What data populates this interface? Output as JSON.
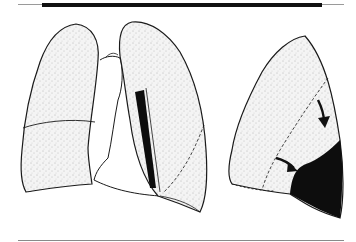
{
  "figure": {
    "panels": [
      {
        "name": "frontal-lungs-view",
        "has_black_region": true
      },
      {
        "name": "lateral-left-lung-view",
        "has_black_region": true,
        "arrows": 2
      }
    ],
    "colors": {
      "outline": "#1a1a1a",
      "stipple_fill": "#f2f2f2",
      "black_region": "#0d0d0d",
      "background": "#ffffff"
    }
  }
}
